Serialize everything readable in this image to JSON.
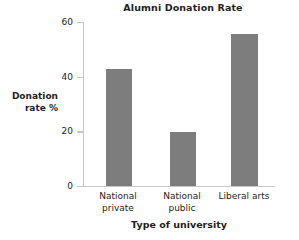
{
  "chart_data": {
    "type": "bar",
    "title": "Alumni Donation Rate",
    "xlabel": "Type of university",
    "ylabel": "Donation rate %",
    "ylabel_lines": [
      "Donation",
      "rate %"
    ],
    "categories": [
      "National private",
      "National public",
      "Liberal arts"
    ],
    "category_lines": [
      [
        "National",
        "private"
      ],
      [
        "National",
        "public"
      ],
      [
        "Liberal arts",
        ""
      ]
    ],
    "values": [
      43,
      20,
      56
    ],
    "ylim": [
      0,
      60
    ],
    "yticks": [
      0,
      20,
      40,
      60
    ],
    "ytick_labels": [
      "0",
      "20",
      "40",
      "60"
    ],
    "grid": false,
    "legend": false,
    "bar_color": "#7d7d7d",
    "axis_color": "#c8c8c8",
    "text_color": "#231f20",
    "background": "#ffffff"
  }
}
